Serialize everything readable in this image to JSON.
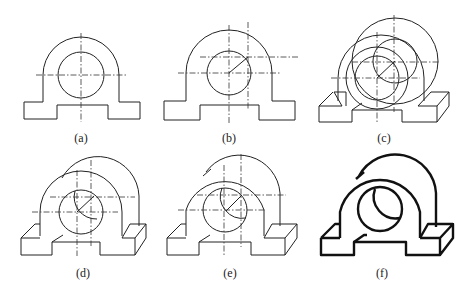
{
  "figure": {
    "panels": [
      {
        "id": "a",
        "label": "(a)",
        "description": "Front view with centerlines"
      },
      {
        "id": "b",
        "label": "(b)",
        "description": "Locate rear center offset along 45° receding axis"
      },
      {
        "id": "c",
        "label": "(c)",
        "description": "Draw rear arcs and base block in oblique view"
      },
      {
        "id": "d",
        "label": "(d)",
        "description": "Trim hidden arcs"
      },
      {
        "id": "e",
        "label": "(e)",
        "description": "Add tangent lines and refine"
      },
      {
        "id": "f",
        "label": "(f)",
        "description": "Final result, bold outline"
      }
    ]
  }
}
